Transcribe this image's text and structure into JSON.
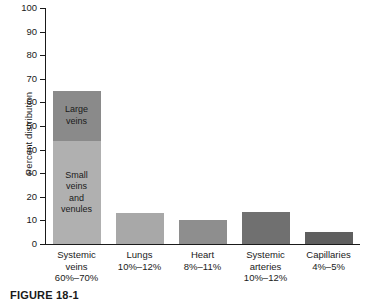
{
  "chart_data": {
    "type": "bar",
    "title": "",
    "xlabel": "",
    "ylabel": "Percent distribution",
    "ylim": [
      0,
      100
    ],
    "yticks": [
      0,
      10,
      20,
      30,
      40,
      50,
      60,
      70,
      80,
      90,
      100
    ],
    "ytick_labels": [
      "0",
      "10",
      "20",
      "30",
      "40",
      "50",
      "60",
      "70",
      "80",
      "90",
      "100"
    ],
    "grid": false,
    "legend": "none",
    "stacked_first_bar": true,
    "categories": [
      "Systemic veins",
      "Lungs",
      "Heart",
      "Systemic arteries",
      "Capillaries"
    ],
    "category_ranges": [
      "60%–70%",
      "10%–12%",
      "8%–11%",
      "10%–12%",
      "4%–5%"
    ],
    "values": [
      65,
      13,
      10,
      13.5,
      5
    ],
    "series": [
      {
        "name": "Small veins and venules",
        "values": [
          43.5,
          0,
          0,
          0,
          0
        ],
        "color": "#b0b0b0"
      },
      {
        "name": "Large veins",
        "values": [
          21.5,
          0,
          0,
          0,
          0
        ],
        "color": "#8a8a8a"
      },
      {
        "name": "Other vessels",
        "values": [
          0,
          13,
          10,
          13.5,
          5
        ],
        "colors": [
          "",
          "#a8a8a8",
          "#8e8e8e",
          "#707070",
          "#5f5f5f"
        ]
      }
    ],
    "annotations": [
      {
        "text": "Large veins",
        "bar": 0,
        "segment": "top"
      },
      {
        "text": "Small veins and venules",
        "bar": 0,
        "segment": "bottom"
      }
    ]
  },
  "bars": [
    {
      "name": "systemic-veins",
      "label_lines": [
        "Systemic",
        "veins",
        "60%–70%"
      ],
      "total": 65,
      "segments": [
        {
          "name": "large-veins",
          "text_lines": [
            "Large",
            "veins"
          ],
          "value": 21.5,
          "color": "#8a8a8a"
        },
        {
          "name": "small-veins-and-venules",
          "text_lines": [
            "Small",
            "veins",
            "and",
            "venules"
          ],
          "value": 43.5,
          "color": "#b0b0b0"
        }
      ]
    },
    {
      "name": "lungs",
      "label_lines": [
        "Lungs",
        "10%–12%"
      ],
      "total": 13,
      "segments": [
        {
          "name": "lungs-bar",
          "text_lines": [],
          "value": 13,
          "color": "#a8a8a8"
        }
      ]
    },
    {
      "name": "heart",
      "label_lines": [
        "Heart",
        "8%–11%"
      ],
      "total": 10,
      "segments": [
        {
          "name": "heart-bar",
          "text_lines": [],
          "value": 10,
          "color": "#8e8e8e"
        }
      ]
    },
    {
      "name": "systemic-arteries",
      "label_lines": [
        "Systemic",
        "arteries",
        "10%–12%"
      ],
      "total": 13.5,
      "segments": [
        {
          "name": "systemic-arteries-bar",
          "text_lines": [],
          "value": 13.5,
          "color": "#707070"
        }
      ]
    },
    {
      "name": "capillaries",
      "label_lines": [
        "Capillaries",
        "4%–5%"
      ],
      "total": 5,
      "segments": [
        {
          "name": "capillaries-bar",
          "text_lines": [],
          "value": 5,
          "color": "#5f5f5f"
        }
      ]
    }
  ],
  "caption": {
    "text": "FIGURE 18-1"
  }
}
